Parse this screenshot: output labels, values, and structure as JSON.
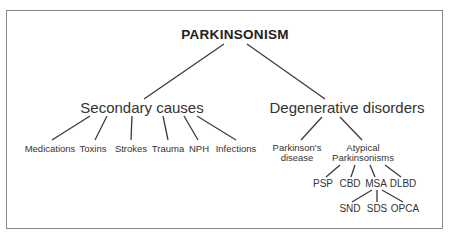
{
  "diagram": {
    "title": "PARKINSONISM",
    "branches": [
      {
        "label": "Secondary causes",
        "children": [
          {
            "label": "Medications"
          },
          {
            "label": "Toxins"
          },
          {
            "label": "Strokes"
          },
          {
            "label": "Trauma"
          },
          {
            "label": "NPH"
          },
          {
            "label": "Infections"
          }
        ]
      },
      {
        "label": "Degenerative disorders",
        "children": [
          {
            "label_line1": "Parkinson's",
            "label_line2": "disease"
          },
          {
            "label_line1": "Atypical",
            "label_line2": "Parkinsonisms",
            "children": [
              {
                "label": "PSP"
              },
              {
                "label": "CBD"
              },
              {
                "label": "MSA",
                "children": [
                  {
                    "label": "SND"
                  },
                  {
                    "label": "SDS"
                  },
                  {
                    "label": "OPCA"
                  }
                ]
              },
              {
                "label": "DLBD"
              }
            ]
          }
        ]
      }
    ]
  },
  "colors": {
    "background": "#ffffff",
    "frame": "#8a8a8a",
    "lines": "#3a3a3a",
    "text": "#333333"
  }
}
